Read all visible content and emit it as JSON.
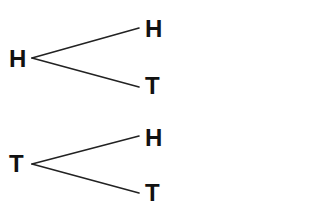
{
  "diagram": {
    "type": "tree-diagram",
    "trees": [
      {
        "root": {
          "label": "H"
        },
        "branches": [
          {
            "label": "H"
          },
          {
            "label": "T"
          }
        ]
      },
      {
        "root": {
          "label": "T"
        },
        "branches": [
          {
            "label": "H"
          },
          {
            "label": "T"
          }
        ]
      }
    ]
  },
  "colors": {
    "background": "#ffffff",
    "text": "#111111",
    "line": "#222222"
  }
}
